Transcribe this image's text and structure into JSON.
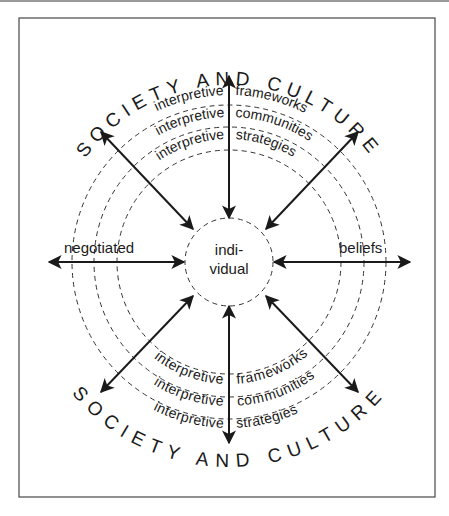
{
  "diagram": {
    "outer_label_top": "SOCIETY AND CULTURE",
    "outer_label_bottom": "SOCIETY AND CULTURE",
    "center_label_line1": "indi-",
    "center_label_line2": "vidual",
    "left_label": "negotiated",
    "right_label": "beliefs",
    "rings_top": [
      {
        "left": "interpretive",
        "right": "frameworks"
      },
      {
        "left": "interpretive",
        "right": "communities"
      },
      {
        "left": "interpretive",
        "right": "strategies"
      }
    ],
    "rings_bottom": [
      {
        "left": "interpretive",
        "right": "frameworks"
      },
      {
        "left": "interpretive",
        "right": "communities"
      },
      {
        "left": "interpretive",
        "right": "strategies"
      }
    ],
    "colors": {
      "ink": "#1a1a1a",
      "frame": "#555555",
      "background": "#ffffff"
    }
  }
}
